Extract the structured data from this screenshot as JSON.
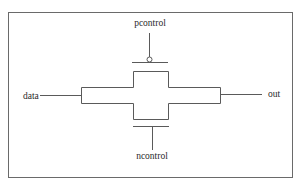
{
  "diagram": {
    "type": "transmission-gate",
    "labels": {
      "pcontrol": "pcontrol",
      "ncontrol": "ncontrol",
      "input": "data",
      "output": "out"
    },
    "colors": {
      "stroke": "#5a5a5a",
      "frame": "#6a6a6a",
      "text": "#2a2a2a",
      "background": "#ffffff"
    }
  }
}
